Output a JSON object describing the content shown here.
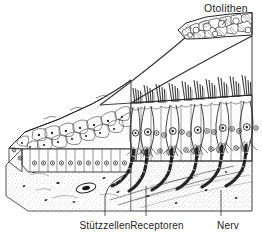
{
  "figure": {
    "title_visible": false,
    "kind": "anatomical-line-drawing",
    "language": "de",
    "background_color": "#ffffff",
    "ink_color": "#1c1c1c",
    "stipple_color": "#6f6f6f"
  },
  "labels": {
    "otolithen": "Otolithen",
    "stuetzzellen": "Stützzellen",
    "receptoren": "Receptoren",
    "nerv": "Nerv"
  },
  "structures": {
    "otolith_layer": "otolith crystal mass",
    "gelatinous_membrane": "gelatinous otolith membrane",
    "hair_bundles": "stereocilia hair bundles",
    "supporting_cells": "supporting cells (Stützzellen)",
    "receptor_cells": "hair / receptor cells (Receptoren)",
    "nerve_fibres": "afferent nerve fibres (Nerv)",
    "connective_tissue": "subepithelial connective tissue",
    "blood_vessel": "blood vessel lumen"
  },
  "counts": {
    "hair_bundles": 12,
    "receptor_cells": 7,
    "nerve_fibres": 7
  }
}
